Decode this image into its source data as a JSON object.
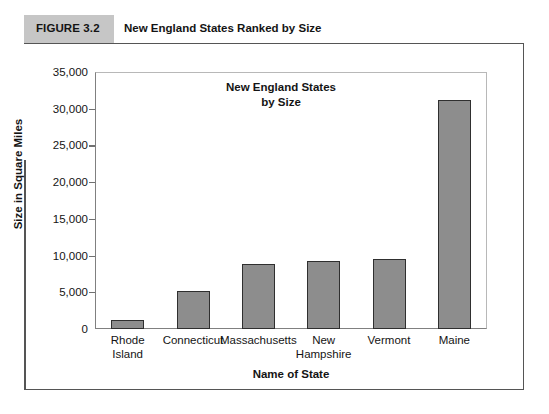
{
  "figure": {
    "tag": "FIGURE 3.2",
    "caption": "New England States Ranked by Size"
  },
  "chart_data": {
    "type": "bar",
    "title": "New England States\nby Size",
    "title_line1": "New England States",
    "title_line2": "by Size",
    "xlabel": "Name of State",
    "ylabel": "Size in Square Miles",
    "categories": [
      "Rhode Island",
      "Connecticut",
      "Massachusetts",
      "New Hampshire",
      "Vermont",
      "Maine"
    ],
    "category_lines": [
      [
        "Rhode",
        "Island"
      ],
      [
        "Connecticut"
      ],
      [
        "Massachusetts"
      ],
      [
        "New",
        "Hampshire"
      ],
      [
        "Vermont"
      ],
      [
        "Maine"
      ]
    ],
    "values": [
      1200,
      5200,
      8900,
      9300,
      9600,
      31200
    ],
    "ylim": [
      0,
      35000
    ],
    "ytick_values": [
      0,
      5000,
      10000,
      15000,
      20000,
      25000,
      30000,
      35000
    ],
    "ytick_labels": [
      "0",
      "5,000",
      "10,000",
      "15,000",
      "20,000",
      "25,000",
      "30,000",
      "35,000"
    ],
    "grid": false,
    "legend": null,
    "bar_color": "#8d8d8d",
    "bar_edge_color": "#2f2f2f"
  }
}
